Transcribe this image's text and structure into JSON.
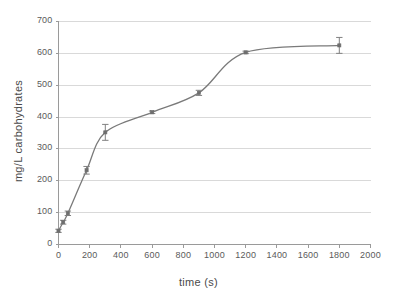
{
  "chart_data": {
    "type": "scatter",
    "title": "",
    "subtitle": "",
    "xlabel": "time (s)",
    "ylabel": "mg/L carbohydrates",
    "xlim": [
      0,
      2000
    ],
    "ylim": [
      0,
      700
    ],
    "xticks": [
      0,
      200,
      400,
      600,
      800,
      1000,
      1200,
      1400,
      1600,
      1800,
      2000
    ],
    "yticks": [
      0,
      100,
      200,
      300,
      400,
      500,
      600,
      700
    ],
    "xtick_labels": [
      "0",
      "200",
      "400",
      "600",
      "800",
      "1000",
      "1200",
      "1400",
      "1600",
      "1800",
      "2000"
    ],
    "ytick_labels": [
      "0",
      "100",
      "200",
      "300",
      "400",
      "500",
      "600",
      "700"
    ],
    "grid": {
      "horizontal": true,
      "vertical": false,
      "color": "#d9d9d9"
    },
    "legend": {
      "visible": false,
      "position": "none",
      "entries": []
    },
    "annotations": [],
    "series": [
      {
        "name": "carbohydrates",
        "marker": "square",
        "line_style": "smooth",
        "color": "#7a7a7a",
        "error_bars": true,
        "x": [
          0,
          30,
          60,
          180,
          300,
          600,
          900,
          1200,
          1800
        ],
        "y": [
          43,
          70,
          98,
          233,
          352,
          415,
          476,
          603,
          625
        ],
        "yerr": [
          5,
          6,
          7,
          12,
          25,
          4,
          8,
          4,
          25
        ]
      }
    ]
  },
  "colors": {
    "line": "#7a7a7a",
    "marker": "#6e6e6e",
    "error_bar": "#808080",
    "grid": "#d9d9d9",
    "axis": "#9a9a9a",
    "text": "#555555",
    "background": "#ffffff"
  }
}
